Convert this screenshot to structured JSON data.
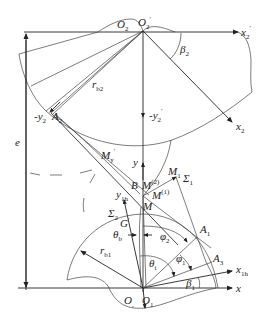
{
  "figure": {
    "type": "gear meshing geometry diagram",
    "labels": {
      "O2": {
        "main": "O",
        "sub": "2"
      },
      "O2p": {
        "main": "O",
        "sub": "2",
        "sup": "′"
      },
      "x2p": {
        "main": "x",
        "sub": "2",
        "sup": "′"
      },
      "beta2": {
        "main": "β",
        "sub": "2"
      },
      "rb2": {
        "main": "r",
        "sub": "b2"
      },
      "neg_y2": {
        "main": "-y",
        "sub": "2"
      },
      "A2": {
        "main": "A",
        "sub": "2"
      },
      "neg_y2p": {
        "main": "-y",
        "sub": "2",
        "sup": "′"
      },
      "x2": {
        "main": "x",
        "sub": "2"
      },
      "e": {
        "main": "e"
      },
      "My": {
        "main": "M",
        "sub": "y",
        "sup": "′"
      },
      "y": {
        "main": "y"
      },
      "M1": {
        "main": "M",
        "sub": "1"
      },
      "Sigma1": {
        "main": "Σ",
        "sub": "1"
      },
      "B": {
        "main": "B"
      },
      "M2": {
        "main": "M",
        "sup": "(2)"
      },
      "y1h": {
        "main": "y",
        "sub": "1h"
      },
      "M1s": {
        "main": "M",
        "sup": "(1)"
      },
      "M": {
        "main": "M"
      },
      "Sigma2": {
        "main": "Σ",
        "sub": "2"
      },
      "G": {
        "main": "G",
        "sup": "′"
      },
      "thetab": {
        "main": "θ",
        "sub": "b"
      },
      "phi2": {
        "main": "φ",
        "sub": "2"
      },
      "A1": {
        "main": "A",
        "sub": "1"
      },
      "rb1": {
        "main": "r",
        "sub": "b1"
      },
      "phi1": {
        "main": "φ",
        "sub": "1"
      },
      "thetai": {
        "main": "θ",
        "sub": "i"
      },
      "A3": {
        "main": "A",
        "sub": "3"
      },
      "x1h": {
        "main": "x",
        "sub": "1h"
      },
      "beta1": {
        "main": "β",
        "sub": "1"
      },
      "x": {
        "main": "x"
      },
      "O": {
        "main": "O",
        "sub": ","
      },
      "O1": {
        "main": "O",
        "sub": "1"
      }
    },
    "colors": {
      "line": "#333333",
      "background": "#ffffff"
    }
  }
}
